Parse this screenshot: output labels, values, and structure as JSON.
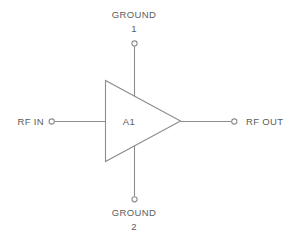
{
  "diagram": {
    "type": "rf-amplifier-block-diagram",
    "background_color": "#ffffff",
    "line_color": "#8d8d8d",
    "text_color": "#5c5c5c",
    "component": {
      "reference_designator": "A1",
      "symbol": "amplifier-triangle"
    },
    "ports": [
      {
        "id": "ground-1",
        "name": "GROUND",
        "number": "1",
        "side": "top",
        "terminal": "open-circle"
      },
      {
        "id": "rf-in",
        "name": "RF IN",
        "number": "",
        "side": "left",
        "terminal": "open-circle"
      },
      {
        "id": "rf-out",
        "name": "RF OUT",
        "number": "",
        "side": "right",
        "terminal": "open-circle"
      },
      {
        "id": "ground-2",
        "name": "GROUND",
        "number": "2",
        "side": "bottom",
        "terminal": "open-circle"
      }
    ]
  }
}
